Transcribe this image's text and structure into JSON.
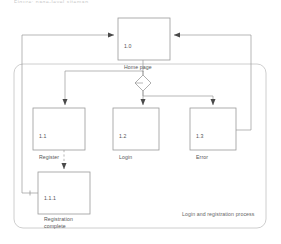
{
  "diagram": {
    "title_strip": "Figure: page-level sitemap",
    "caption": "Login and registration process",
    "colors": {
      "stroke": "#9a9a9a",
      "container_stroke": "#b5b5b5",
      "text": "#555555",
      "caption_text": "#666666",
      "background": "#ffffff"
    },
    "nodes": [
      {
        "key": "home",
        "id": "1.0",
        "title": "Home page",
        "x": 118,
        "y": 18,
        "w": 52,
        "h": 42
      },
      {
        "key": "register",
        "id": "1.1",
        "title": "Register",
        "x": 33,
        "y": 108,
        "w": 52,
        "h": 42
      },
      {
        "key": "login",
        "id": "1.2",
        "title": "Login",
        "x": 113,
        "y": 108,
        "w": 46,
        "h": 42
      },
      {
        "key": "error",
        "id": "1.3",
        "title": "Error",
        "x": 190,
        "y": 108,
        "w": 46,
        "h": 42
      },
      {
        "key": "regdone",
        "id": "1.1.1",
        "title": "Registration\ncomplete",
        "x": 38,
        "y": 172,
        "w": 52,
        "h": 42
      }
    ],
    "decision": {
      "key": "branch",
      "cx": 143,
      "cy": 83,
      "r": 8
    },
    "container": {
      "x": 14,
      "y": 64,
      "w": 252,
      "h": 164,
      "radius": 9
    },
    "edges": [
      {
        "from": "home",
        "to": "branch",
        "style": "solid",
        "label": ""
      },
      {
        "from": "branch",
        "to": "register",
        "style": "solid",
        "label": ""
      },
      {
        "from": "branch",
        "to": "login",
        "style": "solid",
        "label": ""
      },
      {
        "from": "branch",
        "to": "error",
        "style": "solid",
        "label": ""
      },
      {
        "from": "register",
        "to": "regdone",
        "style": "dashed",
        "label": ""
      },
      {
        "from": "regdone",
        "to": "home",
        "style": "solid",
        "label": ""
      },
      {
        "from": "error",
        "to": "home",
        "style": "solid",
        "label": ""
      }
    ]
  }
}
